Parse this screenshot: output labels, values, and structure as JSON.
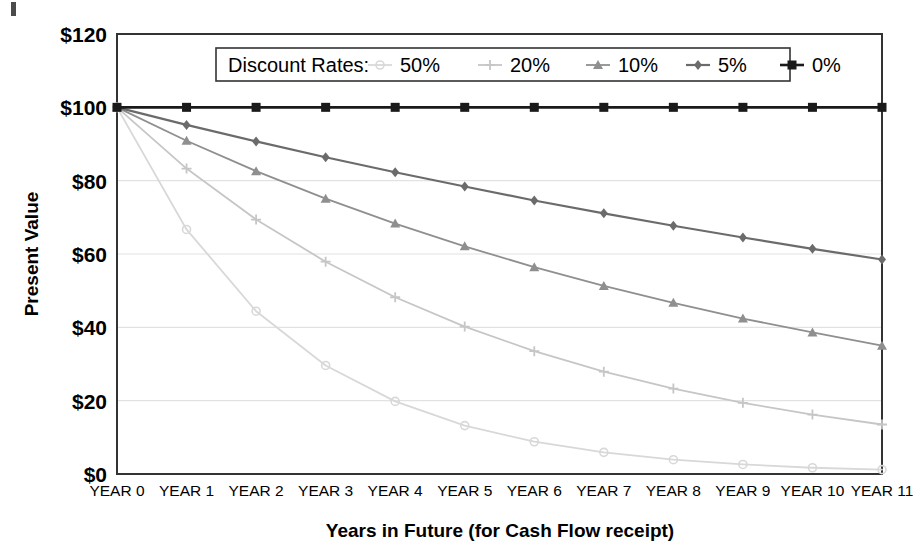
{
  "chart_data": {
    "type": "line",
    "title": "",
    "xlabel": "Years in Future (for Cash Flow receipt)",
    "ylabel": "Present Value",
    "categories": [
      "YEAR 0",
      "YEAR 1",
      "YEAR 2",
      "YEAR 3",
      "YEAR 4",
      "YEAR 5",
      "YEAR 6",
      "YEAR 7",
      "YEAR 8",
      "YEAR 9",
      "YEAR 10",
      "YEAR 11"
    ],
    "x": [
      0,
      1,
      2,
      3,
      4,
      5,
      6,
      7,
      8,
      9,
      10,
      11
    ],
    "ylim": [
      0,
      120
    ],
    "yticks": [
      0,
      20,
      40,
      60,
      80,
      100,
      120
    ],
    "ytick_labels": [
      "$0",
      "$20",
      "$40",
      "$60",
      "$80",
      "$100",
      "$120"
    ],
    "grid": true,
    "grid_axis": "y",
    "legend_position": "top-center-inside",
    "legend_title": "Discount Rates:",
    "series": [
      {
        "name": "50%",
        "rate": 0.5,
        "marker": "circle",
        "color": "#d8d8d8",
        "values": [
          100.0,
          66.7,
          44.4,
          29.6,
          19.8,
          13.2,
          8.8,
          5.9,
          3.9,
          2.6,
          1.7,
          1.2
        ]
      },
      {
        "name": "20%",
        "rate": 0.2,
        "marker": "cross",
        "color": "#c6c6c6",
        "values": [
          100.0,
          83.3,
          69.4,
          57.9,
          48.2,
          40.2,
          33.5,
          27.9,
          23.3,
          19.4,
          16.2,
          13.5
        ]
      },
      {
        "name": "10%",
        "rate": 0.1,
        "marker": "triangle",
        "color": "#8f8f8f",
        "values": [
          100.0,
          90.9,
          82.6,
          75.1,
          68.3,
          62.1,
          56.4,
          51.3,
          46.7,
          42.4,
          38.6,
          35.0
        ]
      },
      {
        "name": "5%",
        "rate": 0.05,
        "marker": "diamond",
        "color": "#6b6b6b",
        "values": [
          100.0,
          95.2,
          90.7,
          86.4,
          82.3,
          78.4,
          74.6,
          71.1,
          67.7,
          64.5,
          61.4,
          58.5
        ]
      },
      {
        "name": "0%",
        "rate": 0.0,
        "marker": "square",
        "color": "#1a1a1a",
        "values": [
          100.0,
          100.0,
          100.0,
          100.0,
          100.0,
          100.0,
          100.0,
          100.0,
          100.0,
          100.0,
          100.0,
          100.0
        ]
      }
    ]
  },
  "colors": {
    "axis": "#333333",
    "grid": "#e2e2e2",
    "plot_background": "#ffffff",
    "legend_border": "#333333"
  }
}
